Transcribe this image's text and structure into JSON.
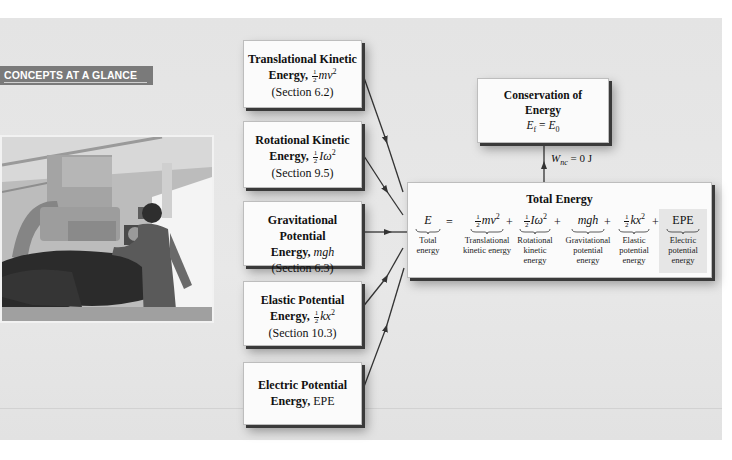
{
  "banner": {
    "label": "CONCEPTS AT A GLANCE"
  },
  "photo": {
    "alt": "Medical imaging equipment with technician and patient"
  },
  "sources": [
    {
      "line1": "Translational Kinetic",
      "line2_word": "Energy,",
      "formula_frac": [
        "1",
        "2"
      ],
      "formula": "mv",
      "sup": "2",
      "section": "(Section 6.2)"
    },
    {
      "line1": "Rotational Kinetic",
      "line2_word": "Energy,",
      "formula_frac": [
        "1",
        "2"
      ],
      "formula": "Iω",
      "sup": "2",
      "section": "(Section 9.5)"
    },
    {
      "line1": "Gravitational Potential",
      "line2_word": "Energy,",
      "formula": "mgh",
      "section": "(Section 6.3)"
    },
    {
      "line1": "Elastic Potential",
      "line2_word": "Energy,",
      "formula_frac": [
        "1",
        "2"
      ],
      "formula": "kx",
      "sup": "2",
      "section": "(Section 10.3)"
    },
    {
      "line1": "Electric Potential",
      "line2_word": "Energy,",
      "formula": "EPE"
    }
  ],
  "conservation": {
    "line1": "Conservation of",
    "line2": "Energy",
    "lhs": "E",
    "lhs_sub": "f",
    "eq": "=",
    "rhs": "E",
    "rhs_sub": "0"
  },
  "condition": {
    "symbol": "W",
    "sub": "nc",
    "value": "= 0 J"
  },
  "total": {
    "title": "Total Energy",
    "terms": [
      {
        "expr": "E",
        "label1": "Total",
        "label2": "energy"
      },
      {
        "frac": [
          "1",
          "2"
        ],
        "expr": "mv",
        "sup": "2",
        "label1": "Translational",
        "label2": "kinetic energy"
      },
      {
        "frac": [
          "1",
          "2"
        ],
        "expr": "Iω",
        "sup": "2",
        "label1": "Rotational",
        "label2": "kinetic energy"
      },
      {
        "expr": "mgh",
        "label1": "Gravitational",
        "label2": "potential",
        "label3": "energy"
      },
      {
        "frac": [
          "1",
          "2"
        ],
        "expr": "kx",
        "sup": "2",
        "label1": "Elastic",
        "label2": "potential",
        "label3": "energy"
      },
      {
        "expr": "EPE",
        "label1": "Electric",
        "label2": "potential",
        "label3": "energy"
      }
    ],
    "operators": [
      "=",
      "+",
      "+",
      "+",
      "+"
    ]
  }
}
